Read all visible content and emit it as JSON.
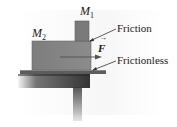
{
  "diagram": {
    "type": "physics-free-body-setup",
    "objects": {
      "upper_block": {
        "label": "M",
        "subscript": "1"
      },
      "lower_block": {
        "label": "M",
        "subscript": "2"
      },
      "force": {
        "label": "F",
        "vector_arrow": "→"
      }
    },
    "annotations": {
      "friction": "Friction",
      "frictionless": "Frictionless"
    },
    "colors": {
      "block": "#8a8a8a",
      "block_dark": "#6a6a6a",
      "table": "#3a3a3a",
      "sheet": "#5a5a5a",
      "arrow": "#555555",
      "leader": "#333333"
    }
  }
}
